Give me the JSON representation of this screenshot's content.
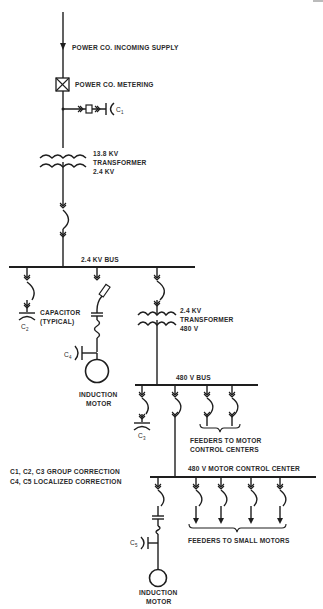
{
  "diagram": {
    "type": "one-line electrical power factor correction diagram",
    "labels": {
      "incoming_supply": "POWER CO. INCOMING SUPPLY",
      "metering": "POWER CO. METERING",
      "c1": "C",
      "c1_sub": "1",
      "main_transformer_primary": "13.8 KV",
      "main_transformer_name": "TRANSFORMER",
      "main_transformer_secondary": "2.4 KV",
      "bus_2400": "2.4 KV BUS",
      "capacitor_label_1": "CAPACITOR",
      "capacitor_label_2": "(TYPICAL)",
      "c2": "C",
      "c2_sub": "2",
      "c4": "C",
      "c4_sub": "4",
      "motor_1_line1": "INDUCTION",
      "motor_1_line2": "MOTOR",
      "sub_transformer_primary": "2.4 KV",
      "sub_transformer_name": "TRANSFORMER",
      "sub_transformer_secondary": "480 V",
      "bus_480": "480 V BUS",
      "c3": "C",
      "c3_sub": "3",
      "feeders_mcc_1": "FEEDERS TO MOTOR",
      "feeders_mcc_2": "CONTROL CENTERS",
      "mcc": "480 V MOTOR CONTROL CENTER",
      "legend_1": "C1, C2, C3 GROUP CORRECTION",
      "legend_2": "C4, C5 LOCALIZED CORRECTION",
      "c5": "C",
      "c5_sub": "5",
      "feeders_small": "FEEDERS TO SMALL MOTORS",
      "motor_2_line1": "INDUCTION",
      "motor_2_line2": "MOTOR"
    },
    "legend": [
      {
        "capacitors": [
          "C1",
          "C2",
          "C3"
        ],
        "type": "GROUP CORRECTION"
      },
      {
        "capacitors": [
          "C4",
          "C5"
        ],
        "type": "LOCALIZED CORRECTION"
      }
    ],
    "colors": {
      "line": "#1e1e1e",
      "text": "#2a2a2a",
      "background": "#ffffff"
    }
  }
}
